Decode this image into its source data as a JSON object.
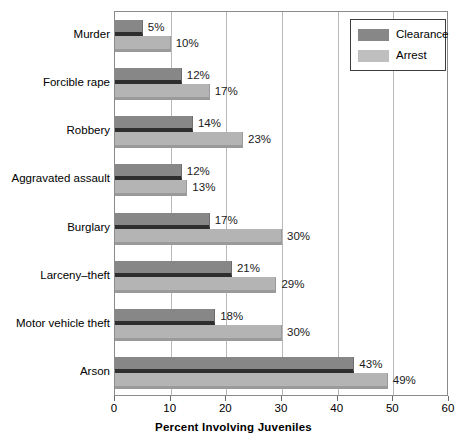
{
  "chart_data": {
    "type": "bar",
    "orientation": "horizontal",
    "title": "",
    "xlabel": "Percent Involving Juveniles",
    "ylabel": "",
    "xlim": [
      0,
      60
    ],
    "xticks": [
      0,
      10,
      20,
      30,
      40,
      50,
      60
    ],
    "xtick_labels": [
      "0",
      "10",
      "20",
      "30",
      "40",
      "50",
      "60"
    ],
    "grid": true,
    "grid_axis": "x",
    "legend_position": "top-right",
    "categories": [
      "Murder",
      "Forcible rape",
      "Robbery",
      "Aggravated assault",
      "Burglary",
      "Larceny-theft",
      "Motor vehicle theft",
      "Arson"
    ],
    "series": [
      {
        "name": "Clearance",
        "color": "#878787",
        "values": [
          5,
          12,
          14,
          12,
          17,
          21,
          18,
          43
        ],
        "value_labels": [
          "5%",
          "12%",
          "14%",
          "12%",
          "17%",
          "21%",
          "18%",
          "43%"
        ]
      },
      {
        "name": "Arrest",
        "color": "#b4b4b4",
        "values": [
          10,
          17,
          23,
          13,
          30,
          29,
          30,
          49
        ],
        "value_labels": [
          "10%",
          "17%",
          "23%",
          "13%",
          "30%",
          "29%",
          "30%",
          "49%"
        ]
      }
    ]
  },
  "legend": {
    "entries": [
      {
        "label": "Clearance",
        "swatch": "clearance"
      },
      {
        "label": "Arrest",
        "swatch": "arrest"
      }
    ]
  }
}
